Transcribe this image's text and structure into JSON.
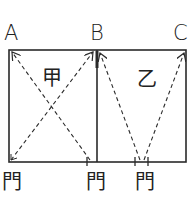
{
  "points": {
    "A": "A",
    "B": "B",
    "C": "C"
  },
  "rooms": {
    "left": "甲",
    "right": "乙"
  },
  "doors": [
    "門",
    "門",
    "門"
  ],
  "colors": {
    "line": "#2a2a2a",
    "background": "#ffffff"
  }
}
